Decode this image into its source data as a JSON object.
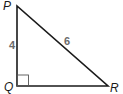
{
  "diagram": {
    "type": "right-triangle",
    "vertices": {
      "P": {
        "label": "P",
        "x": 17,
        "y": 6
      },
      "Q": {
        "label": "Q",
        "x": 17,
        "y": 86
      },
      "R": {
        "label": "R",
        "x": 108,
        "y": 86
      }
    },
    "sides": {
      "PQ": {
        "label": "4"
      },
      "PR": {
        "label": "6"
      },
      "QR": {
        "label": ""
      }
    },
    "right_angle_at": "Q",
    "colors": {
      "stroke": "#1a1a1a",
      "right_angle_mark": "#555555",
      "side_label": "#6b6b6b"
    }
  }
}
